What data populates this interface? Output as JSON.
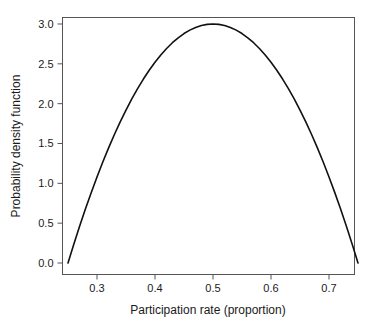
{
  "chart_data": {
    "type": "line",
    "title": "",
    "xlabel": "Participation rate (proportion)",
    "ylabel": "Probability density function",
    "xlim": [
      0.25,
      0.75
    ],
    "ylim": [
      0.0,
      3.1
    ],
    "xticks": [
      0.3,
      0.4,
      0.5,
      0.6,
      0.7
    ],
    "xtick_labels": [
      "0.3",
      "0.4",
      "0.5",
      "0.6",
      "0.7"
    ],
    "yticks": [
      0.0,
      0.5,
      1.0,
      1.5,
      2.0,
      2.5,
      3.0
    ],
    "ytick_labels": [
      "0.0",
      "0.5",
      "1.0",
      "1.5",
      "2.0",
      "2.5",
      "3.0"
    ],
    "grid": false,
    "legend": false,
    "legend_position": "none",
    "curve_color": "#111111",
    "frame_color": "#555555",
    "series": [
      {
        "name": "Probability density function",
        "x": [
          0.25,
          0.26,
          0.27,
          0.28,
          0.29,
          0.3,
          0.31,
          0.32,
          0.33,
          0.34,
          0.35,
          0.36,
          0.37,
          0.38,
          0.39,
          0.4,
          0.41,
          0.42,
          0.43,
          0.44,
          0.45,
          0.46,
          0.47,
          0.48,
          0.49,
          0.5,
          0.51,
          0.52,
          0.53,
          0.54,
          0.55,
          0.56,
          0.57,
          0.58,
          0.59,
          0.6,
          0.61,
          0.62,
          0.63,
          0.64,
          0.65,
          0.66,
          0.67,
          0.68,
          0.69,
          0.7,
          0.71,
          0.72,
          0.73,
          0.74,
          0.75
        ],
        "y": [
          0.0,
          0.235,
          0.461,
          0.677,
          0.883,
          1.08,
          1.267,
          1.445,
          1.613,
          1.771,
          1.92,
          2.059,
          2.189,
          2.309,
          2.419,
          2.52,
          2.611,
          2.693,
          2.765,
          2.827,
          2.88,
          2.923,
          2.957,
          2.981,
          2.995,
          3.0,
          2.995,
          2.981,
          2.957,
          2.923,
          2.88,
          2.827,
          2.765,
          2.693,
          2.611,
          2.52,
          2.419,
          2.309,
          2.189,
          2.059,
          1.92,
          1.771,
          1.613,
          1.445,
          1.267,
          1.08,
          0.883,
          0.677,
          0.461,
          0.235,
          0.0
        ]
      }
    ],
    "annotations": []
  },
  "axes": {
    "x_title": "Participation rate (proportion)",
    "y_title": "Probability density function"
  }
}
